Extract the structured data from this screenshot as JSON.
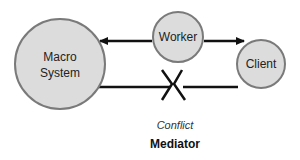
{
  "diagram": {
    "nodes": {
      "macro": {
        "line1": "Macro",
        "line2": "System"
      },
      "worker": {
        "label": "Worker"
      },
      "client": {
        "label": "Client"
      }
    },
    "labels": {
      "conflict": "Conflict",
      "mediator": "Mediator"
    },
    "colors": {
      "node_fill": "#dcdcdc",
      "node_stroke": "#7a7a7a",
      "line": "#111111"
    }
  }
}
